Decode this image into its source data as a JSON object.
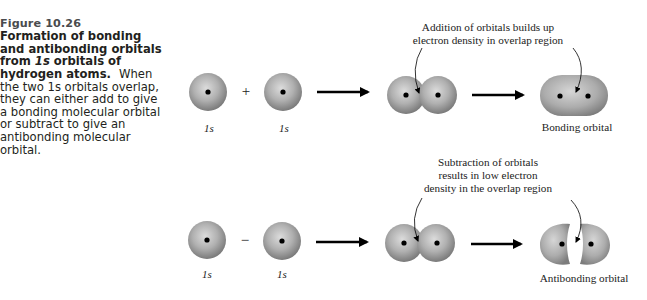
{
  "caption": {
    "figure_number": "Figure 10.26",
    "title_part1": "Formation of bonding and antibonding orbitals from ",
    "title_italic": "1s",
    "title_part2": " orbitals of hydrogen atoms.",
    "body": "When the two 1s orbitals overlap, they can either add to give a bonding molecular orbital or subtract to give an antibonding molecular orbital."
  },
  "bonding_row": {
    "orbital_left_label": "1s",
    "operator": "+",
    "orbital_right_label": "1s",
    "annotation_line1": "Addition of orbitals builds up",
    "annotation_line2": "electron density in overlap region",
    "result_label": "Bonding orbital"
  },
  "antibonding_row": {
    "orbital_left_label": "1s",
    "operator": "−",
    "orbital_right_label": "1s",
    "annotation_line1": "Subtraction of orbitals",
    "annotation_line2": "results in low electron",
    "annotation_line3": "density in the overlap region",
    "result_label": "Antibonding orbital"
  },
  "colors": {
    "orbital_light": "#d4d4d4",
    "orbital_mid": "#a8a8a8",
    "orbital_dark": "#7a7a7a",
    "nucleus": "#000000",
    "arrow": "#000000",
    "figure_number": "#4a4b4d"
  }
}
